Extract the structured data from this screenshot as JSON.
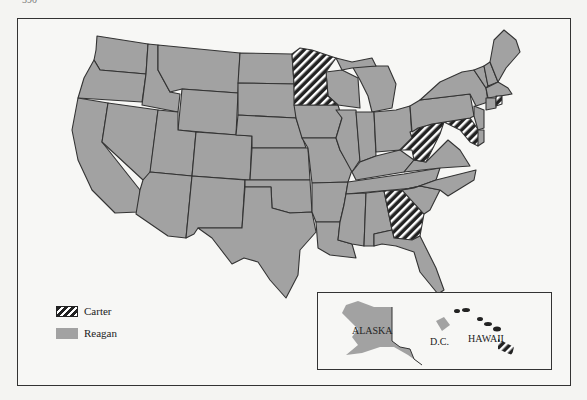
{
  "page": {
    "number": "390"
  },
  "map": {
    "title": "1980 Presidential Election Results by State",
    "colors": {
      "reagan": "#a2a2a2",
      "carter_hatch_dark": "#222222",
      "carter_hatch_light": "#ffffff",
      "border": "#333333",
      "background": "#f7f7f5"
    },
    "carter_states": [
      "Minnesota",
      "Wisconsin?",
      "West Virginia",
      "Maryland",
      "Rhode Island",
      "Georgia",
      "Hawaii",
      "D.C."
    ],
    "reagan_states_note": "All other states"
  },
  "legend": {
    "items": [
      {
        "label": "Carter",
        "pattern": "hatched"
      },
      {
        "label": "Reagan",
        "pattern": "solid-gray"
      }
    ]
  },
  "inset": {
    "labels": {
      "alaska": "ALASKA",
      "dc": "D.C.",
      "hawaii": "HAWAII"
    }
  }
}
